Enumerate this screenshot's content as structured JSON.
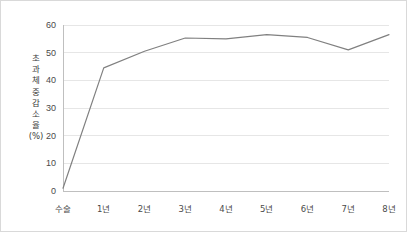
{
  "chart_data": {
    "type": "line",
    "title": "",
    "xlabel": "",
    "ylabel": "초과체중감소율(%)",
    "ylabel_chars": "초\n과\n체\n중\n감\n소\n율\n(%)",
    "categories": [
      "수술",
      "1년",
      "2년",
      "3년",
      "4년",
      "5년",
      "6년",
      "7년",
      "8년"
    ],
    "values": [
      1.0,
      44.5,
      50.5,
      55.3,
      55.0,
      56.5,
      55.5,
      51.0,
      56.5
    ],
    "ylim": [
      0,
      60
    ],
    "yticks": [
      0,
      10,
      20,
      30,
      40,
      50,
      60
    ],
    "ytick_labels": [
      "0",
      "10",
      "20",
      "30",
      "40",
      "50",
      "60"
    ],
    "grid": true,
    "grid_axis": "y",
    "legend": false,
    "legend_position": "none",
    "line_color": "#808080",
    "line_width": 1.2,
    "markers": false,
    "axis_color": "#bfbfbf",
    "grid_color": "#e6e6e6",
    "background": "#ffffff",
    "border_color": "#d9d9d9"
  }
}
